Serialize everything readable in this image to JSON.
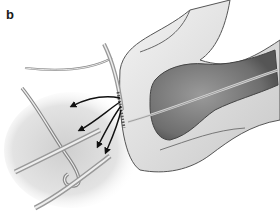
{
  "figure": {
    "panel_label": "b",
    "colors": {
      "background": "#ffffff",
      "shadow_region": "#d9d9d9",
      "organ_dark": "#8a8a8a",
      "outline": "#4a4a4a",
      "arrow": "#111111"
    }
  }
}
